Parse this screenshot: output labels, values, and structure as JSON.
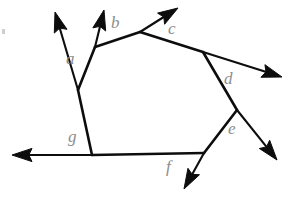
{
  "figure": {
    "type": "line-diagram",
    "width": 300,
    "height": 199,
    "background_color": "#ffffff",
    "stroke_color": "#0d0d0d",
    "label_color": "#8d8d8d",
    "stroke_width": 2.6,
    "vertices": [
      {
        "id": "a",
        "x": 78,
        "y": 90
      },
      {
        "id": "b",
        "x": 95,
        "y": 47
      },
      {
        "id": "c",
        "x": 140,
        "y": 32
      },
      {
        "id": "d",
        "x": 203,
        "y": 52
      },
      {
        "id": "e",
        "x": 237,
        "y": 110
      },
      {
        "id": "f",
        "x": 204,
        "y": 153
      },
      {
        "id": "g",
        "x": 92,
        "y": 155
      }
    ],
    "polygon_edges": [
      {
        "from": "a",
        "to": "b"
      },
      {
        "from": "b",
        "to": "c"
      },
      {
        "from": "c",
        "to": "d"
      },
      {
        "from": "d",
        "to": "e"
      },
      {
        "from": "e",
        "to": "f"
      },
      {
        "from": "f",
        "to": "g"
      },
      {
        "from": "g",
        "to": "a"
      }
    ],
    "rays": [
      {
        "id": "ray-a",
        "from": "a",
        "tip_x": 55,
        "tip_y": 12,
        "angle_label": "a"
      },
      {
        "id": "ray-b",
        "from": "b",
        "tip_x": 104,
        "tip_y": 10,
        "angle_label": "b"
      },
      {
        "id": "ray-c",
        "from": "c",
        "tip_x": 178,
        "tip_y": 8,
        "angle_label": "c"
      },
      {
        "id": "ray-d",
        "from": "d",
        "tip_x": 282,
        "tip_y": 77,
        "angle_label": "d"
      },
      {
        "id": "ray-e",
        "from": "e",
        "tip_x": 277,
        "tip_y": 160,
        "angle_label": "e"
      },
      {
        "id": "ray-f",
        "from": "f",
        "tip_x": 184,
        "tip_y": 189,
        "angle_label": "f"
      },
      {
        "id": "ray-g",
        "from": "g",
        "tip_x": 12,
        "tip_y": 155,
        "angle_label": "g"
      }
    ],
    "labels": [
      {
        "id": "a",
        "text": "a",
        "x": 66,
        "y": 50
      },
      {
        "id": "b",
        "text": "b",
        "x": 111,
        "y": 14
      },
      {
        "id": "c",
        "text": "c",
        "x": 168,
        "y": 20
      },
      {
        "id": "d",
        "text": "d",
        "x": 224,
        "y": 70
      },
      {
        "id": "e",
        "text": "e",
        "x": 228,
        "y": 120
      },
      {
        "id": "f",
        "text": "f",
        "x": 166,
        "y": 158
      },
      {
        "id": "g",
        "text": "g",
        "x": 68,
        "y": 128
      }
    ]
  }
}
